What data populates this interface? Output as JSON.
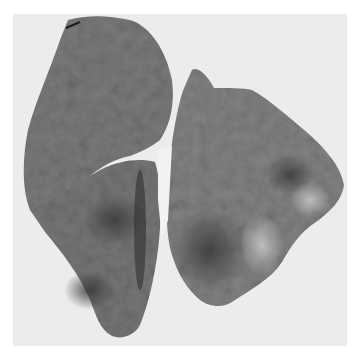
{
  "image": {
    "subject": "gross pathology specimen photograph",
    "description": "Two sliced lung lobe specimens on a light background, mottled gray tissue with darker consolidated regions",
    "colors": {
      "page": "#ffffff",
      "backdrop": "#ececec",
      "tissue": "#7a7a7a",
      "tissue_dark": "#4a4a4a",
      "tissue_light": "#a8a8a8",
      "highlight": "#d6d6d6",
      "shadow": "#1e1e1e"
    }
  }
}
